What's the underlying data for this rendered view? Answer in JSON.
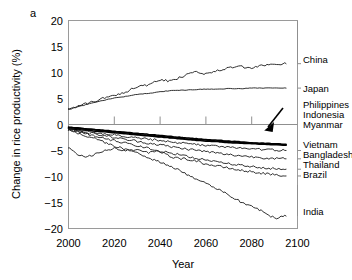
{
  "panel": {
    "letter": "a"
  },
  "axes": {
    "xlabel": "Year",
    "ylabel": "Change in rice productivity (%)",
    "xticks": [
      "2000",
      "2020",
      "2040",
      "2060",
      "2080",
      "2100"
    ],
    "yticks": [
      "20",
      "15",
      "10",
      "5",
      "0",
      "−5",
      "−10",
      "−15",
      "−20"
    ]
  },
  "labels": {
    "china": "China",
    "japan": "Japan",
    "philippines": "Philippines",
    "indonesia": "Indonesia",
    "myanmar": "Myanmar",
    "vietnam": "Vietnam",
    "bangladesh": "Bangladesh",
    "thailand": "Thailand",
    "brazil": "Brazil",
    "india": "India"
  },
  "chart_data": {
    "type": "line",
    "title": "",
    "xlabel": "Year",
    "ylabel": "Change in rice productivity (%)",
    "xlim": [
      2000,
      2100
    ],
    "ylim": [
      -20,
      20
    ],
    "xticks": [
      2000,
      2020,
      2040,
      2060,
      2080,
      2100
    ],
    "yticks": [
      20,
      15,
      10,
      5,
      0,
      -5,
      -10,
      -15,
      -20
    ],
    "grid": false,
    "legend_position": "right-of-axes-inline-labels",
    "annotations": [
      {
        "type": "arrow",
        "text": "",
        "points_to": "bold merged Philippines/Indonesia/Myanmar cluster",
        "xy": [
          2090,
          -3.8
        ],
        "xytext": [
          2096,
          -1.2
        ]
      }
    ],
    "x": [
      2000,
      2005,
      2010,
      2015,
      2020,
      2025,
      2030,
      2035,
      2040,
      2045,
      2050,
      2055,
      2060,
      2065,
      2070,
      2075,
      2080,
      2085,
      2090,
      2095
    ],
    "series": [
      {
        "name": "China",
        "style": "thin",
        "values": [
          3.0,
          3.6,
          4.3,
          5.0,
          5.6,
          6.3,
          7.3,
          7.6,
          8.5,
          8.4,
          9.3,
          10.2,
          9.8,
          10.3,
          10.9,
          11.1,
          10.8,
          11.4,
          11.6,
          11.7
        ]
      },
      {
        "name": "Japan",
        "style": "thin",
        "values": [
          3.0,
          3.5,
          4.1,
          4.6,
          5.1,
          5.4,
          5.8,
          6.0,
          6.3,
          6.5,
          6.6,
          6.7,
          6.8,
          6.8,
          6.9,
          6.9,
          7.0,
          7.0,
          7.0,
          7.0
        ]
      },
      {
        "name": "Philippines",
        "style": "bold",
        "values": [
          -0.5,
          -0.7,
          -0.9,
          -1.1,
          -1.3,
          -1.5,
          -1.7,
          -1.9,
          -2.1,
          -2.3,
          -2.5,
          -2.7,
          -2.9,
          -3.0,
          -3.2,
          -3.3,
          -3.5,
          -3.6,
          -3.7,
          -3.8
        ]
      },
      {
        "name": "Indonesia",
        "style": "bold",
        "values": [
          -0.6,
          -0.8,
          -1.0,
          -1.2,
          -1.4,
          -1.6,
          -1.9,
          -2.1,
          -2.3,
          -2.5,
          -2.7,
          -2.9,
          -3.0,
          -3.2,
          -3.3,
          -3.5,
          -3.6,
          -3.7,
          -3.8,
          -3.9
        ]
      },
      {
        "name": "Myanmar",
        "style": "bold",
        "values": [
          -0.8,
          -1.0,
          -1.2,
          -1.4,
          -1.6,
          -1.8,
          -2.0,
          -2.2,
          -2.4,
          -2.6,
          -2.8,
          -3.0,
          -3.2,
          -3.3,
          -3.5,
          -3.6,
          -3.7,
          -3.8,
          -3.9,
          -4.0
        ]
      },
      {
        "name": "Vietnam",
        "style": "thin",
        "values": [
          -0.9,
          -1.2,
          -1.5,
          -1.8,
          -2.0,
          -2.3,
          -2.6,
          -2.8,
          -3.1,
          -3.4,
          -3.6,
          -3.8,
          -4.0,
          -4.2,
          -4.4,
          -4.5,
          -4.7,
          -4.8,
          -4.9,
          -5.0
        ]
      },
      {
        "name": "Bangladesh",
        "style": "thin",
        "values": [
          -0.9,
          -1.3,
          -1.7,
          -2.1,
          -2.5,
          -2.9,
          -3.2,
          -3.6,
          -3.9,
          -4.3,
          -4.6,
          -4.9,
          -5.2,
          -5.5,
          -5.8,
          -6.0,
          -6.2,
          -6.4,
          -6.5,
          -6.6
        ]
      },
      {
        "name": "Thailand",
        "style": "thin",
        "values": [
          -1.0,
          -1.5,
          -2.1,
          -2.6,
          -3.1,
          -3.6,
          -4.1,
          -4.6,
          -5.1,
          -5.5,
          -6.0,
          -6.4,
          -6.8,
          -7.2,
          -7.5,
          -7.8,
          -8.1,
          -8.3,
          -8.5,
          -8.6
        ]
      },
      {
        "name": "Brazil",
        "style": "thin",
        "values": [
          -4.5,
          -6.0,
          -5.9,
          -5.2,
          -4.6,
          -5.0,
          -4.9,
          -5.4,
          -5.3,
          -6.2,
          -6.6,
          -6.9,
          -7.6,
          -8.0,
          -8.4,
          -8.8,
          -9.1,
          -9.4,
          -9.7,
          -9.9
        ]
      },
      {
        "name": "India",
        "style": "thin",
        "values": [
          -1.0,
          -1.8,
          -2.5,
          -3.3,
          -4.1,
          -4.8,
          -5.5,
          -6.4,
          -7.2,
          -8.2,
          -9.2,
          -10.3,
          -11.3,
          -12.4,
          -13.6,
          -14.8,
          -15.7,
          -16.8,
          -17.9,
          -17.6
        ]
      }
    ]
  }
}
